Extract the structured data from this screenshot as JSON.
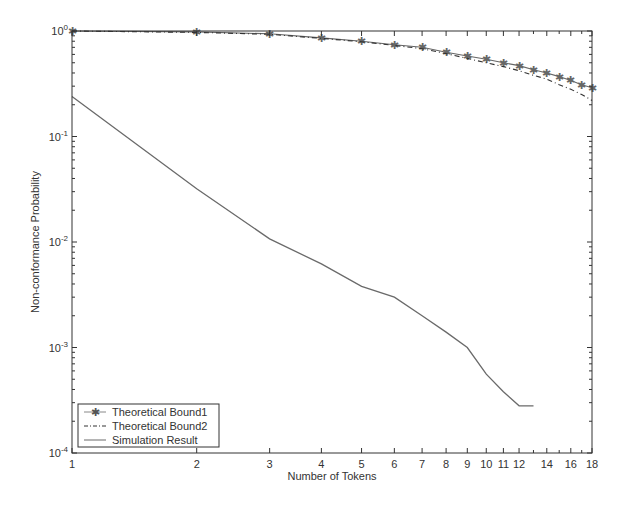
{
  "chart_data": {
    "type": "line",
    "title": "",
    "xlabel": "Number of Tokens",
    "ylabel": "Non-conformance Probability",
    "xscale": "log",
    "yscale": "log",
    "xlim": [
      1,
      18
    ],
    "ylim": [
      0.0001,
      1
    ],
    "grid": false,
    "legend_position": "lower left",
    "x_ticks": [
      1,
      2,
      3,
      4,
      5,
      6,
      7,
      8,
      9,
      10,
      11,
      12,
      14,
      16,
      18
    ],
    "x_tick_labels": [
      "1",
      "2",
      "3",
      "4",
      "5",
      "6",
      "7",
      "8",
      "9",
      "10",
      "11",
      "12",
      "14",
      "16",
      "18"
    ],
    "y_ticks": [
      0.0001,
      0.001,
      0.01,
      0.1,
      1
    ],
    "y_tick_labels": [
      {
        "base": "10",
        "exp": "-4"
      },
      {
        "base": "10",
        "exp": "-3"
      },
      {
        "base": "10",
        "exp": "-2"
      },
      {
        "base": "10",
        "exp": "-1"
      },
      {
        "base": "10",
        "exp": "0"
      }
    ],
    "series": [
      {
        "name": "Theoretical Bound1",
        "style": "solid-with-star-markers",
        "x": [
          1,
          2,
          3,
          4,
          5,
          6,
          7,
          8,
          9,
          10,
          11,
          12,
          13,
          14,
          15,
          16,
          17,
          18
        ],
        "values": [
          1.0,
          0.98,
          0.94,
          0.86,
          0.8,
          0.74,
          0.7,
          0.63,
          0.58,
          0.54,
          0.5,
          0.47,
          0.43,
          0.4,
          0.37,
          0.34,
          0.31,
          0.29
        ]
      },
      {
        "name": "Theoretical Bound2",
        "style": "dash-dot",
        "x": [
          1,
          2,
          3,
          4,
          5,
          6,
          7,
          8,
          9,
          10,
          11,
          12,
          13,
          14,
          15,
          16,
          17,
          18
        ],
        "values": [
          1.0,
          0.97,
          0.93,
          0.85,
          0.79,
          0.73,
          0.68,
          0.61,
          0.55,
          0.5,
          0.46,
          0.42,
          0.38,
          0.35,
          0.31,
          0.28,
          0.25,
          0.22
        ]
      },
      {
        "name": "Simulation Result",
        "style": "solid",
        "x": [
          1,
          2,
          3,
          4,
          5,
          6,
          7,
          8,
          9,
          10,
          11,
          12,
          13
        ],
        "values": [
          0.24,
          0.032,
          0.0107,
          0.0062,
          0.0038,
          0.003,
          0.002,
          0.0014,
          0.001,
          0.00056,
          0.00038,
          0.00028,
          0.00028
        ]
      }
    ]
  },
  "legend": {
    "items": [
      {
        "label": "Theoretical Bound1"
      },
      {
        "label": "Theoretical Bound2"
      },
      {
        "label": "Simulation Result"
      }
    ]
  },
  "colors": {
    "axis": "#333333",
    "bound1": "#666666",
    "bound2": "#333333",
    "simulation": "#6a6a6a"
  }
}
